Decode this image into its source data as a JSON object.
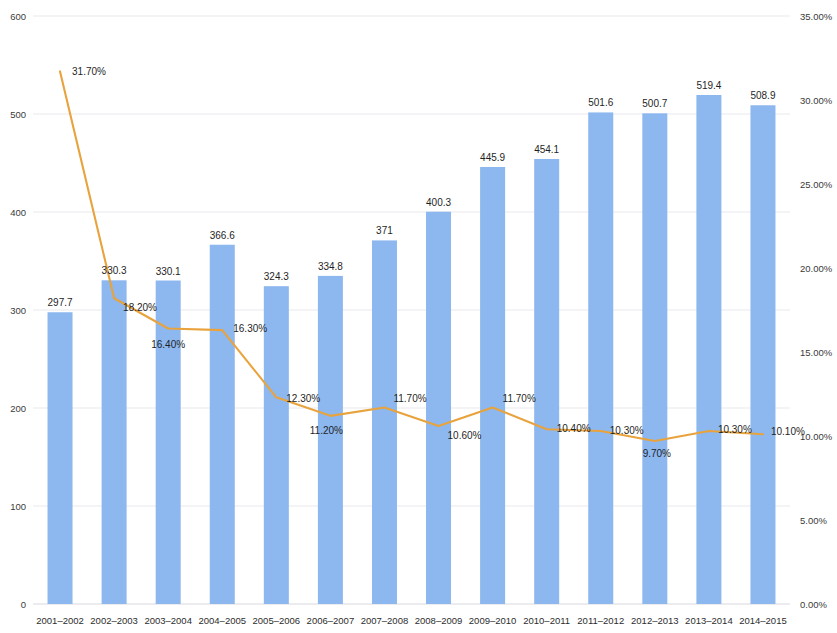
{
  "chart_data": {
    "type": "bar",
    "title": "",
    "subtitle": "",
    "xlabel": "",
    "ylabel": "",
    "y2label": "",
    "grid": true,
    "legend_position": "none",
    "categories": [
      "2001–2002",
      "2002–2003",
      "2003–2004",
      "2004–2005",
      "2005–2006",
      "2006–2007",
      "2007–2008",
      "2008–2009",
      "2009–2010",
      "2010–2011",
      "2011–2012",
      "2012–2013",
      "2013–2014",
      "2014–2015"
    ],
    "ylim": [
      0,
      600
    ],
    "yticks": [
      "0",
      "100",
      "200",
      "300",
      "400",
      "500",
      "600"
    ],
    "ytick_values": [
      0,
      100,
      200,
      300,
      400,
      500,
      600
    ],
    "y2lim": [
      0,
      35
    ],
    "y2ticks": [
      "0.00%",
      "5.00%",
      "10.00%",
      "15.00%",
      "20.00%",
      "25.00%",
      "30.00%",
      "35.00%"
    ],
    "y2tick_values": [
      0,
      5,
      10,
      15,
      20,
      25,
      30,
      35
    ],
    "series": [
      {
        "name": "Value",
        "type": "bar",
        "axis": "left",
        "color": "#8cb7ef",
        "values": [
          297.7,
          330.3,
          330.1,
          366.6,
          324.3,
          334.8,
          371,
          400.3,
          445.9,
          454.1,
          501.6,
          500.7,
          519.4,
          508.9
        ],
        "labels": [
          "297.7",
          "330.3",
          "330.1",
          "366.6",
          "324.3",
          "334.8",
          "371",
          "400.3",
          "445.9",
          "454.1",
          "501.6",
          "500.7",
          "519.4",
          "508.9"
        ]
      },
      {
        "name": "Percentage",
        "type": "line",
        "axis": "right",
        "color": "#e8a33d",
        "values": [
          31.7,
          18.2,
          16.4,
          16.3,
          12.3,
          11.2,
          11.7,
          10.6,
          11.7,
          10.4,
          10.3,
          9.7,
          10.3,
          10.1
        ],
        "labels": [
          "31.70%",
          "18.20%",
          "16.40%",
          "16.30%",
          "12.30%",
          "11.20%",
          "11.70%",
          "10.60%",
          "11.70%",
          "10.40%",
          "10.30%",
          "9.70%",
          "10.30%",
          "10.10%"
        ]
      }
    ]
  }
}
